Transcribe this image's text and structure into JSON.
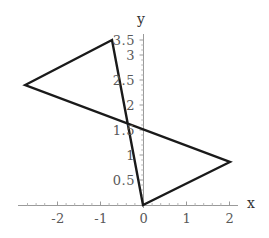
{
  "chart_data": {
    "type": "line",
    "title": "",
    "subtitle": "",
    "xlabel": "x",
    "ylabel": "y",
    "xlim": [
      -2.9,
      2.2
    ],
    "ylim": [
      -0.1,
      3.55
    ],
    "grid": false,
    "legend": null,
    "background_color": "#ffffff",
    "axis_color": "#9a9a9a",
    "curve_color": "#1a1a1a",
    "tick_label_color": "#595959",
    "axis_name_color": "#333333",
    "xticks": [
      {
        "value": -2,
        "label": "-2"
      },
      {
        "value": -1,
        "label": "-1"
      },
      {
        "value": 0,
        "label": "0"
      },
      {
        "value": 1,
        "label": "1"
      },
      {
        "value": 2,
        "label": "2"
      }
    ],
    "yticks": [
      {
        "value": 0.5,
        "label": "0.5"
      },
      {
        "value": 1,
        "label": "1"
      },
      {
        "value": 1.5,
        "label": "1.5"
      },
      {
        "value": 2,
        "label": "2"
      },
      {
        "value": 2.5,
        "label": "2.5"
      },
      {
        "value": 3,
        "label": "3"
      },
      {
        "value": 3.5,
        "label": "3.5"
      }
    ],
    "series": [
      {
        "name": "parallelogram",
        "closed": true,
        "points": [
          {
            "x": 0,
            "y": 0
          },
          {
            "x": -0.72,
            "y": 3.3
          },
          {
            "x": -2.74,
            "y": 2.4
          },
          {
            "x": 2.02,
            "y": 0.86
          }
        ]
      }
    ]
  }
}
